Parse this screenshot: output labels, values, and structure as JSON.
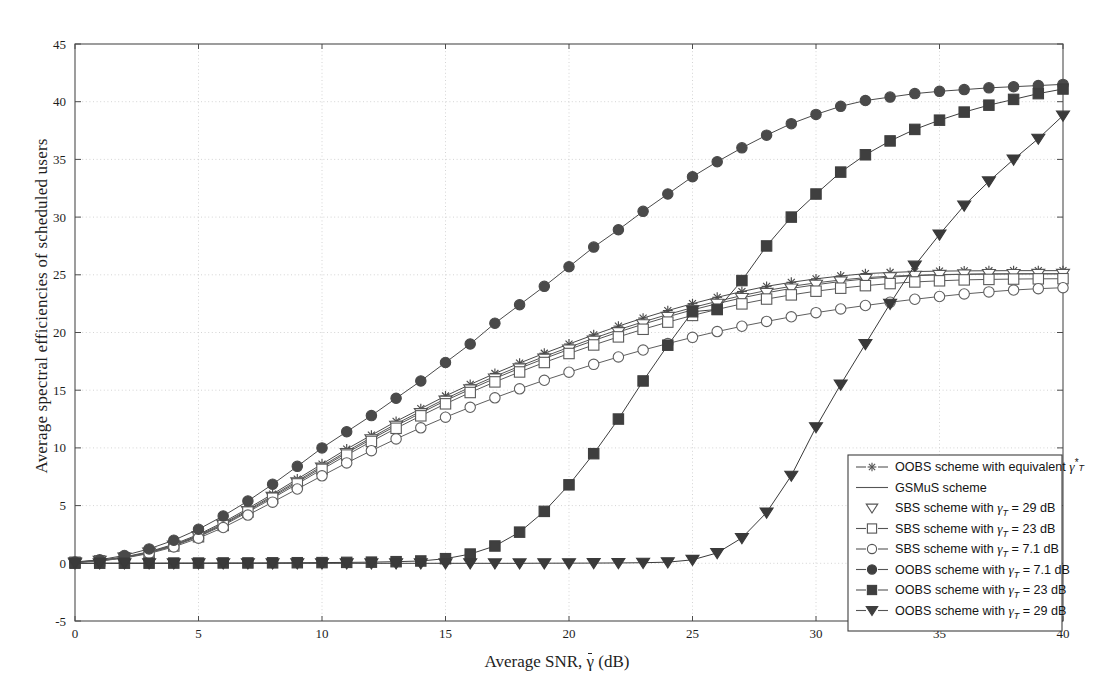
{
  "chart_data": {
    "type": "line",
    "title": "",
    "xlabel": "Average SNR, γ̄ (dB)",
    "ylabel": "Average spectral efficiencies of scheduled users",
    "xlim": [
      0,
      40
    ],
    "ylim": [
      -5,
      45
    ],
    "xticks": [
      0,
      5,
      10,
      15,
      20,
      25,
      30,
      35,
      40
    ],
    "yticks": [
      -5,
      0,
      5,
      10,
      15,
      20,
      25,
      30,
      35,
      40,
      45
    ],
    "grid": true,
    "legend_position": "lower-right",
    "x": [
      0,
      1,
      2,
      3,
      4,
      5,
      6,
      7,
      8,
      9,
      10,
      11,
      12,
      13,
      14,
      15,
      16,
      17,
      18,
      19,
      20,
      21,
      22,
      23,
      24,
      25,
      26,
      27,
      28,
      29,
      30,
      31,
      32,
      33,
      34,
      35,
      36,
      37,
      38,
      39,
      40
    ],
    "series": [
      {
        "name": "OOBS scheme with equivalent γ*_T",
        "marker": "star",
        "filled": false,
        "color": "#4a4a4a",
        "values": [
          0.1,
          0.25,
          0.55,
          1.0,
          1.65,
          2.5,
          3.55,
          4.75,
          6.0,
          7.3,
          8.6,
          9.9,
          11.1,
          12.3,
          13.4,
          14.5,
          15.5,
          16.45,
          17.35,
          18.2,
          19.0,
          19.8,
          20.55,
          21.25,
          21.9,
          22.5,
          23.05,
          23.55,
          24.0,
          24.35,
          24.65,
          24.9,
          25.1,
          25.2,
          25.28,
          25.32,
          25.34,
          25.35,
          25.36,
          25.36,
          25.36
        ]
      },
      {
        "name": "GSMuS scheme",
        "marker": "none",
        "filled": false,
        "color": "#555555",
        "values": [
          0.1,
          0.24,
          0.52,
          0.96,
          1.58,
          2.42,
          3.44,
          4.62,
          5.86,
          7.14,
          8.42,
          9.7,
          10.9,
          12.08,
          13.18,
          14.26,
          15.26,
          16.2,
          17.08,
          17.92,
          18.72,
          19.5,
          20.24,
          20.92,
          21.56,
          22.16,
          22.7,
          23.2,
          23.64,
          24.0,
          24.3,
          24.55,
          24.75,
          24.88,
          24.96,
          25.02,
          25.05,
          25.07,
          25.08,
          25.08,
          25.08
        ]
      },
      {
        "name": "SBS scheme with γ_T = 29 dB",
        "marker": "triangle-down",
        "filled": false,
        "color": "#555555",
        "values": [
          0.09,
          0.22,
          0.5,
          0.93,
          1.54,
          2.36,
          3.36,
          4.54,
          5.76,
          7.02,
          8.3,
          9.56,
          10.76,
          11.92,
          13.02,
          14.1,
          15.08,
          16.02,
          16.9,
          17.74,
          18.54,
          19.3,
          20.04,
          20.72,
          21.36,
          21.96,
          22.5,
          23.0,
          23.44,
          23.82,
          24.14,
          24.42,
          24.64,
          24.8,
          24.92,
          25.0,
          25.04,
          25.07,
          25.08,
          25.09,
          25.09
        ]
      },
      {
        "name": "SBS scheme with γ_T = 23 dB",
        "marker": "square",
        "filled": false,
        "color": "#5a5a5a",
        "values": [
          0.09,
          0.21,
          0.48,
          0.9,
          1.5,
          2.3,
          3.28,
          4.44,
          5.64,
          6.88,
          8.14,
          9.38,
          10.56,
          11.7,
          12.78,
          13.82,
          14.8,
          15.72,
          16.58,
          17.4,
          18.18,
          18.92,
          19.62,
          20.28,
          20.9,
          21.48,
          22.0,
          22.48,
          22.9,
          23.26,
          23.58,
          23.84,
          24.06,
          24.24,
          24.38,
          24.48,
          24.56,
          24.6,
          24.63,
          24.65,
          24.66
        ]
      },
      {
        "name": "SBS scheme with γ_T = 7.1 dB",
        "marker": "circle",
        "filled": false,
        "color": "#5f5f5f",
        "values": [
          0.08,
          0.2,
          0.45,
          0.85,
          1.42,
          2.18,
          3.1,
          4.18,
          5.3,
          6.44,
          7.58,
          8.7,
          9.76,
          10.78,
          11.74,
          12.66,
          13.52,
          14.34,
          15.12,
          15.86,
          16.56,
          17.24,
          17.88,
          18.48,
          19.04,
          19.58,
          20.08,
          20.54,
          20.96,
          21.36,
          21.72,
          22.04,
          22.34,
          22.62,
          22.88,
          23.12,
          23.34,
          23.52,
          23.68,
          23.8,
          23.88
        ]
      },
      {
        "name": "OOBS scheme with γ_T = 7.1 dB",
        "marker": "circle",
        "filled": true,
        "color": "#4a4a4a",
        "values": [
          0.12,
          0.3,
          0.68,
          1.25,
          2.0,
          2.95,
          4.1,
          5.4,
          6.85,
          8.4,
          10.0,
          11.4,
          12.8,
          14.3,
          15.8,
          17.4,
          19.0,
          20.8,
          22.4,
          24.0,
          25.7,
          27.4,
          28.9,
          30.5,
          32.0,
          33.5,
          34.8,
          36.0,
          37.1,
          38.1,
          38.9,
          39.6,
          40.1,
          40.4,
          40.7,
          40.9,
          41.05,
          41.2,
          41.3,
          41.4,
          41.5
        ]
      },
      {
        "name": "OOBS scheme with γ_T = 23 dB",
        "marker": "square",
        "filled": true,
        "color": "#3f3f3f",
        "values": [
          0.01,
          0.01,
          0.01,
          0.01,
          0.02,
          0.02,
          0.03,
          0.03,
          0.04,
          0.05,
          0.06,
          0.08,
          0.1,
          0.14,
          0.2,
          0.4,
          0.8,
          1.5,
          2.7,
          4.5,
          6.8,
          9.5,
          12.5,
          15.8,
          18.9,
          21.8,
          22.0,
          24.5,
          27.5,
          30.0,
          32.0,
          33.9,
          35.4,
          36.6,
          37.6,
          38.4,
          39.1,
          39.7,
          40.2,
          40.7,
          41.1
        ]
      },
      {
        "name": "OOBS scheme with γ_T = 29 dB",
        "marker": "triangle-down",
        "filled": true,
        "color": "#3a3a3a",
        "values": [
          0.0,
          0.0,
          0.0,
          0.0,
          0.0,
          0.0,
          0.0,
          0.0,
          0.0,
          0.0,
          0.0,
          0.0,
          0.0,
          0.0,
          0.0,
          0.0,
          0.0,
          0.0,
          0.0,
          0.01,
          0.01,
          0.02,
          0.03,
          0.05,
          0.1,
          0.3,
          0.9,
          2.2,
          4.4,
          7.6,
          11.8,
          15.5,
          19.0,
          22.5,
          25.8,
          28.5,
          31.0,
          33.1,
          35.0,
          36.8,
          38.8
        ]
      }
    ]
  },
  "legend": {
    "entries": [
      {
        "prefix": "OOBS scheme with equivalent ",
        "gamma": "γ",
        "sup": "*",
        "sub": "T",
        "suffix": "",
        "marker": "star",
        "filled": false,
        "line": true
      },
      {
        "prefix": "GSMuS scheme",
        "gamma": "",
        "sup": "",
        "sub": "",
        "suffix": "",
        "marker": "none",
        "filled": false,
        "line": true
      },
      {
        "prefix": "SBS scheme with ",
        "gamma": "γ",
        "sup": "",
        "sub": "T",
        "suffix": " = 29 dB",
        "marker": "triangle-down",
        "filled": false,
        "line": false
      },
      {
        "prefix": "SBS scheme with ",
        "gamma": "γ",
        "sup": "",
        "sub": "T",
        "suffix": " = 23 dB",
        "marker": "square",
        "filled": false,
        "line": true
      },
      {
        "prefix": "SBS scheme with ",
        "gamma": "γ",
        "sup": "",
        "sub": "T",
        "suffix": " = 7.1 dB",
        "marker": "circle",
        "filled": false,
        "line": true
      },
      {
        "prefix": "OOBS scheme with ",
        "gamma": "γ",
        "sup": "",
        "sub": "T",
        "suffix": " = 7.1 dB",
        "marker": "circle",
        "filled": true,
        "line": true
      },
      {
        "prefix": "OOBS scheme with ",
        "gamma": "γ",
        "sup": "",
        "sub": "T",
        "suffix": " = 23 dB",
        "marker": "square",
        "filled": true,
        "line": true
      },
      {
        "prefix": "OOBS scheme with ",
        "gamma": "γ",
        "sup": "",
        "sub": "T",
        "suffix": " = 29 dB",
        "marker": "triangle-down",
        "filled": true,
        "line": true
      }
    ]
  },
  "axes": {
    "xlabel_pre": "Average SNR, ",
    "xlabel_gamma": "γ",
    "xlabel_post": " (dB)",
    "ylabel": "Average spectral efficiencies of scheduled users"
  },
  "colors": {
    "axis": "#4d4d4d",
    "grid": "#c9c9c9",
    "ink": "#3f3f3f",
    "background": "#ffffff"
  }
}
